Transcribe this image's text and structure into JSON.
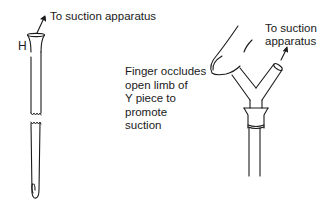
{
  "left_figure": {
    "arrow_label": "To suction apparatus",
    "hole_label": "H"
  },
  "right_figure": {
    "arrow_label_line1": "To suction",
    "arrow_label_line2": "apparatus",
    "caption_lines": [
      "Finger occludes",
      "open limb of",
      "Y piece to",
      "promote",
      "suction"
    ]
  },
  "colors": {
    "line": "#1a1a1a",
    "background": "#ffffff"
  }
}
